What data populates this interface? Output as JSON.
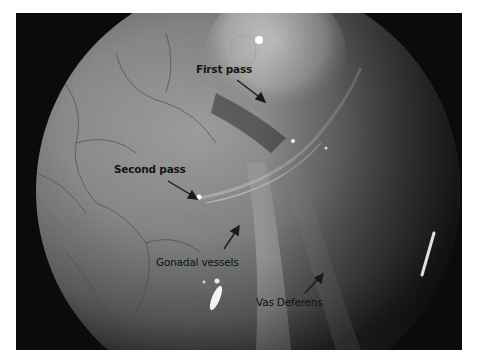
{
  "figure": {
    "background_color": "#0c0c0c",
    "tissue_color": "#8a8a8a"
  },
  "annotations": [
    {
      "id": "first_pass",
      "label": "First pass"
    },
    {
      "id": "second_pass",
      "label": "Second pass"
    },
    {
      "id": "gonadal_vessels",
      "label": "Gonadal vessels"
    },
    {
      "id": "vas_deferens",
      "label": "Vas Deferens"
    }
  ]
}
